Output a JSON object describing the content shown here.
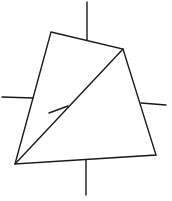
{
  "diagram": {
    "type": "quadrilateral-with-diagonal",
    "stroke_color": "#1a1a1a",
    "background": "#ffffff",
    "vertices": {
      "top_left": [
        51,
        32
      ],
      "top_right": [
        123,
        49
      ],
      "bottom_right": [
        156,
        155
      ],
      "bottom_left": [
        15,
        164
      ]
    },
    "diagonal": {
      "from": [
        15,
        164
      ],
      "to": [
        123,
        49
      ]
    },
    "diagonal_tick": {
      "from": [
        49,
        113
      ],
      "to": [
        68,
        106
      ]
    },
    "axis_stubs": {
      "top": {
        "from": [
          87,
          2
        ],
        "to": [
          87,
          40
        ]
      },
      "left": {
        "from": [
          2,
          97
        ],
        "to": [
          33,
          98
        ]
      },
      "right": {
        "from": [
          141,
          103
        ],
        "to": [
          166,
          105
        ]
      },
      "bottom": {
        "from": [
          86,
          160
        ],
        "to": [
          86,
          195
        ]
      }
    }
  }
}
